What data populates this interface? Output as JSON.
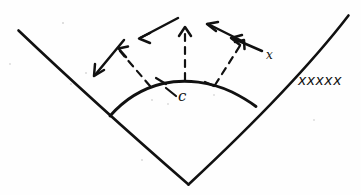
{
  "figure": {
    "type": "hand-drawn-sketch",
    "background_color": "#fefefe",
    "ink_color": "#111111",
    "width": 361,
    "height": 195
  },
  "labels": {
    "center_point": "c",
    "right_arrow_tail": "x",
    "right_side_series": "xxxxx"
  },
  "shapes": {
    "left_arm_name": "left-wedge-arm",
    "right_arm_name": "right-wedge-arm",
    "arc_name": "wedge-arc",
    "vertex_name": "wedge-vertex"
  },
  "arrows": {
    "items": [
      {
        "name": "outward-arrow-far-left",
        "style": "solid",
        "direction": "down-left"
      },
      {
        "name": "outward-arrow-left",
        "style": "solid",
        "direction": "up-left"
      },
      {
        "name": "outward-arrow-upper-left",
        "style": "solid",
        "direction": "left"
      },
      {
        "name": "outward-arrow-center",
        "style": "solid",
        "direction": "up"
      },
      {
        "name": "outward-arrow-upper-right",
        "style": "solid",
        "direction": "left"
      },
      {
        "name": "outward-arrow-right",
        "style": "solid",
        "direction": "up-right"
      },
      {
        "name": "outward-arrow-far-right",
        "style": "solid",
        "direction": "left"
      }
    ]
  },
  "dashed_rays": {
    "items": [
      {
        "name": "dashed-ray-left",
        "direction": "up-left"
      },
      {
        "name": "dashed-ray-center",
        "direction": "up"
      },
      {
        "name": "dashed-ray-right",
        "direction": "up-right"
      }
    ]
  }
}
